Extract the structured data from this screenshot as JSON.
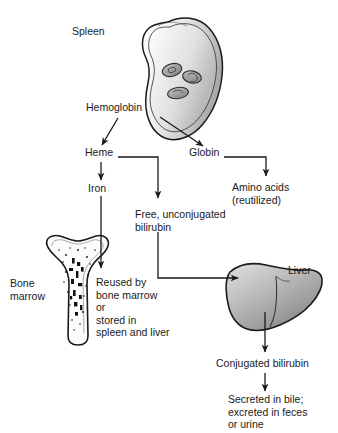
{
  "diagram": {
    "colors": {
      "stroke": "#1a1a1a",
      "text": "#1a1a1a",
      "background": "#ffffff",
      "spleen_light": "#f2f2f2",
      "spleen_dark": "#b8b8b8",
      "liver_light": "#d6d6d6",
      "liver_dark": "#8f8f8f",
      "rbc_fill": "#9e9e9e",
      "bone_fill": "#fbfbfb",
      "marrow_speckle": "#111111"
    },
    "organs": [
      {
        "name": "spleen",
        "label": "Spleen"
      },
      {
        "name": "bone",
        "label": "Bone\nmarrow"
      },
      {
        "name": "liver",
        "label": "Liver"
      }
    ],
    "nodes": [
      {
        "id": "hemoglobin",
        "label": "Hemoglobin"
      },
      {
        "id": "heme",
        "label": "Heme"
      },
      {
        "id": "globin",
        "label": "Globin"
      },
      {
        "id": "iron",
        "label": "Iron"
      },
      {
        "id": "amino_acids",
        "label": "Amino acids\n(reutilized)"
      },
      {
        "id": "free_bilirubin",
        "label": "Free, unconjugated\nbilirubin"
      },
      {
        "id": "reused",
        "label": "Reused by\nbone marrow\nor\nstored in\nspleen and liver"
      },
      {
        "id": "conjugated_bilirubin",
        "label": "Conjugated bilirubin"
      },
      {
        "id": "secreted",
        "label": "Secreted in bile;\nexcreted in feces\nor urine"
      }
    ],
    "edges": [
      {
        "from": "hemoglobin",
        "to": "heme"
      },
      {
        "from": "hemoglobin",
        "to": "globin"
      },
      {
        "from": "heme",
        "to": "iron"
      },
      {
        "from": "heme",
        "to": "free_bilirubin"
      },
      {
        "from": "globin",
        "to": "amino_acids"
      },
      {
        "from": "iron",
        "to": "reused"
      },
      {
        "from": "free_bilirubin",
        "to": "liver"
      },
      {
        "from": "liver",
        "to": "conjugated_bilirubin"
      },
      {
        "from": "conjugated_bilirubin",
        "to": "secreted"
      }
    ]
  }
}
